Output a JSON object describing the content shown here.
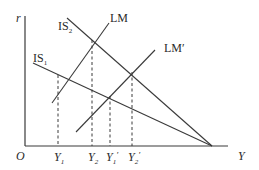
{
  "diagram": {
    "type": "IS-LM model",
    "axes": {
      "y_label": "r",
      "x_label": "Y",
      "origin_label": "O"
    },
    "curves": [
      {
        "id": "IS2",
        "label": "IS",
        "subscript": "2",
        "from": [
          67,
          18
        ],
        "to": [
          212,
          146
        ]
      },
      {
        "id": "IS1",
        "label": "IS",
        "subscript": "1",
        "from": [
          33,
          63
        ],
        "to": [
          212,
          146
        ]
      },
      {
        "id": "LM",
        "label": "LM",
        "from": [
          52,
          103
        ],
        "to": [
          109,
          23
        ]
      },
      {
        "id": "LM_prime",
        "label": "LM′",
        "from": [
          76,
          132
        ],
        "to": [
          155,
          50
        ]
      }
    ],
    "equilibria": [
      {
        "id": "E1",
        "curves": [
          "IS1",
          "LM"
        ],
        "point": [
          58,
          75
        ],
        "x_label": "Y",
        "x_sub": "1",
        "prime": ""
      },
      {
        "id": "E2",
        "curves": [
          "IS2",
          "LM"
        ],
        "point": [
          92,
          40
        ],
        "x_label": "Y",
        "x_sub": "2",
        "prime": ""
      },
      {
        "id": "E3",
        "curves": [
          "IS1",
          "LM_prime"
        ],
        "point": [
          110,
          96
        ],
        "x_label": "Y",
        "x_sub": "1",
        "prime": "′"
      },
      {
        "id": "E4",
        "curves": [
          "IS2",
          "LM_prime"
        ],
        "point": [
          132,
          72
        ],
        "x_label": "Y",
        "x_sub": "2",
        "prime": "′"
      }
    ],
    "colors": {
      "line": "#3a3a3a",
      "background": "#ffffff"
    }
  }
}
